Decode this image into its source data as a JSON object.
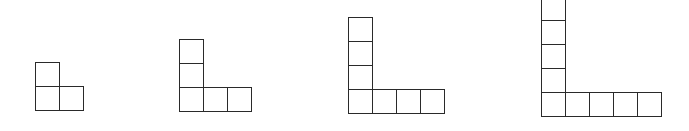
{
  "diagram": {
    "line_color": "#2a2a2a",
    "background": "#ffffff",
    "figures": [
      {
        "index": 1,
        "vertical_squares": 2,
        "horizontal_squares": 2,
        "total_squares": 3,
        "left": 35,
        "bottom": 110,
        "cell": 24
      },
      {
        "index": 2,
        "vertical_squares": 3,
        "horizontal_squares": 3,
        "total_squares": 5,
        "left": 179,
        "bottom": 111,
        "cell": 24
      },
      {
        "index": 3,
        "vertical_squares": 4,
        "horizontal_squares": 4,
        "total_squares": 7,
        "left": 348,
        "bottom": 113,
        "cell": 24
      },
      {
        "index": 4,
        "vertical_squares": 5,
        "horizontal_squares": 5,
        "total_squares": 9,
        "left": 541,
        "bottom": 116,
        "cell": 24
      }
    ]
  }
}
